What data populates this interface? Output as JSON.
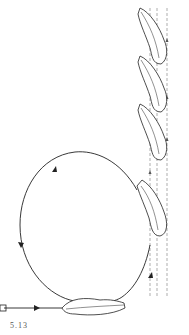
{
  "figure": {
    "caption": "5.13",
    "colors": {
      "stroke": "#222222",
      "dashed": "#777777",
      "background": "#ffffff"
    }
  }
}
